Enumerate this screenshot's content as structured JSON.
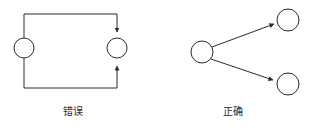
{
  "figure": {
    "background_color": "#ffffff",
    "stroke_color": "#2b2b2b",
    "text_color": "#2b2b2b",
    "width": 309,
    "height": 132
  },
  "panels": {
    "wrong": {
      "caption": "错误",
      "meaning": "wrong",
      "description": "Two paths leaving one node converge with arrowheads into a single node",
      "nodes": [
        {
          "id": "w-source",
          "cx": 24,
          "cy": 48,
          "r": 10
        },
        {
          "id": "w-target",
          "cx": 117,
          "cy": 48,
          "r": 10
        }
      ],
      "edges": [
        {
          "id": "w-edge-top",
          "from": "w-source",
          "to": "w-target",
          "arrow": "to",
          "route": "up-over-down"
        },
        {
          "id": "w-edge-bottom",
          "from": "w-source",
          "to": "w-target",
          "arrow": "to",
          "route": "down-under-up"
        }
      ]
    },
    "correct": {
      "caption": "正确",
      "meaning": "correct",
      "description": "One node fans out with straight arrows to two separate nodes",
      "nodes": [
        {
          "id": "c-source",
          "cx": 202,
          "cy": 52,
          "r": 11
        },
        {
          "id": "c-target-top",
          "cx": 288,
          "cy": 20,
          "r": 11
        },
        {
          "id": "c-target-bottom",
          "cx": 288,
          "cy": 84,
          "r": 11
        }
      ],
      "edges": [
        {
          "id": "c-edge-top",
          "from": "c-source",
          "to": "c-target-top",
          "arrow": "to",
          "route": "straight"
        },
        {
          "id": "c-edge-bottom",
          "from": "c-source",
          "to": "c-target-bottom",
          "arrow": "to",
          "route": "straight"
        }
      ]
    }
  }
}
